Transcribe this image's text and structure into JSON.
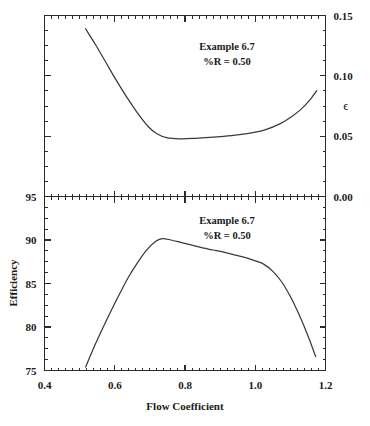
{
  "figure": {
    "title": "",
    "background": "#ffffff",
    "ink_color": "#2b2b2b"
  },
  "chart_data": [
    {
      "type": "line",
      "panel": "upper",
      "title": "",
      "xlabel": "",
      "ylabel": "ϵ",
      "ylabel_side": "right",
      "xlim": [
        0.4,
        1.2
      ],
      "ylim": [
        0.0,
        0.15
      ],
      "xticks": [
        0.4,
        0.6,
        0.8,
        1.0,
        1.2
      ],
      "xticklabels": [
        "",
        "",
        "",
        "",
        ""
      ],
      "yticks": [
        0.0,
        0.05,
        0.1,
        0.15
      ],
      "yticklabels": [
        "0.00",
        "0.05",
        "0.10",
        "0.15"
      ],
      "ytick_side": "right",
      "minor_ticks": true,
      "grid": false,
      "annotations": [
        "Example 6.7",
        "%R = 0.50"
      ],
      "series": [
        {
          "name": "loss-coefficient",
          "x": [
            0.517,
            0.545,
            0.575,
            0.605,
            0.635,
            0.665,
            0.695,
            0.72,
            0.75,
            0.79,
            0.83,
            0.87,
            0.91,
            0.95,
            0.99,
            1.03,
            1.07,
            1.1,
            1.13,
            1.155,
            1.175
          ],
          "y": [
            0.139,
            0.126,
            0.111,
            0.096,
            0.082,
            0.069,
            0.058,
            0.052,
            0.0485,
            0.0478,
            0.0482,
            0.0489,
            0.0498,
            0.051,
            0.0528,
            0.0555,
            0.0602,
            0.0655,
            0.0722,
            0.0798,
            0.0878
          ]
        }
      ]
    },
    {
      "type": "line",
      "panel": "lower",
      "title": "",
      "xlabel": "Flow Coefficient",
      "ylabel": "Efficiency",
      "ylabel_side": "left",
      "xlim": [
        0.4,
        1.2
      ],
      "ylim": [
        75,
        95
      ],
      "xticks": [
        0.4,
        0.6,
        0.8,
        1.0,
        1.2
      ],
      "xticklabels": [
        "0.4",
        "0.6",
        "0.8",
        "1.0",
        "1.2"
      ],
      "yticks": [
        75,
        80,
        85,
        90,
        95
      ],
      "yticklabels": [
        "75",
        "80",
        "85",
        "90",
        "95"
      ],
      "ytick_side": "left",
      "minor_ticks": true,
      "grid": false,
      "annotations": [
        "Example 6.7",
        "%R = 0.50"
      ],
      "series": [
        {
          "name": "efficiency",
          "x": [
            0.517,
            0.54,
            0.565,
            0.59,
            0.615,
            0.64,
            0.665,
            0.69,
            0.715,
            0.735,
            0.76,
            0.79,
            0.82,
            0.85,
            0.88,
            0.91,
            0.94,
            0.97,
            1.0,
            1.025,
            1.05,
            1.075,
            1.1,
            1.125,
            1.15,
            1.172
          ],
          "y": [
            75.4,
            77.6,
            79.8,
            81.9,
            83.9,
            85.8,
            87.4,
            88.8,
            89.8,
            90.15,
            90.0,
            89.7,
            89.4,
            89.1,
            88.85,
            88.6,
            88.3,
            88.0,
            87.6,
            87.2,
            86.4,
            85.2,
            83.5,
            81.4,
            79.0,
            76.6
          ]
        }
      ]
    }
  ],
  "annotations": {
    "example_label": "Example 6.7",
    "reaction_label": "%R = 0.50"
  },
  "axes": {
    "x_title": "Flow Coefficient",
    "y_title_lower": "Efficiency",
    "y_title_upper": "ϵ",
    "x_tick_labels": [
      "0.4",
      "0.6",
      "0.8",
      "1.0",
      "1.2"
    ],
    "y_tick_labels_lower": [
      "75",
      "80",
      "85",
      "90",
      "95"
    ],
    "y_tick_labels_upper": [
      "0.00",
      "0.05",
      "0.10",
      "0.15"
    ]
  }
}
